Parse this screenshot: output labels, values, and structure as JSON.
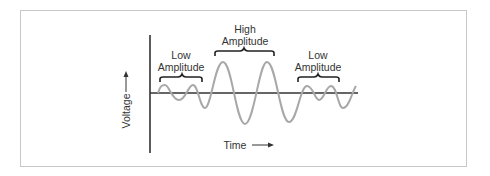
{
  "diagram": {
    "title": "",
    "y_axis_label": "Voltage",
    "x_axis_label": "Time",
    "annotations": [
      {
        "line1": "Low",
        "line2": "Amplitude",
        "region": "start"
      },
      {
        "line1": "High",
        "line2": "Amplitude",
        "region": "middle"
      },
      {
        "line1": "Low",
        "line2": "Amplitude",
        "region": "end"
      }
    ],
    "colors": {
      "wave": "#a8a8a8",
      "axes": "#333333",
      "frame": "#c8c8c8",
      "text": "#333333"
    }
  }
}
